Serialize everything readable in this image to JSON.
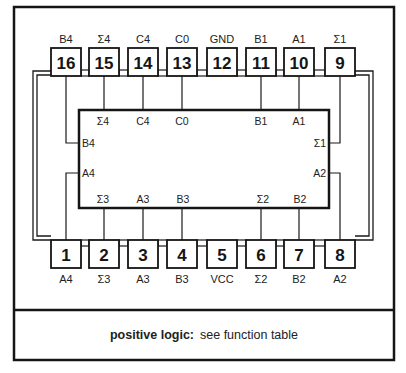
{
  "diagram": {
    "type": "ic-pinout",
    "package": "16-pin dual-in-line",
    "top_pins": [
      {
        "number": "16",
        "label": "B4"
      },
      {
        "number": "15",
        "label": "Σ4"
      },
      {
        "number": "14",
        "label": "C4"
      },
      {
        "number": "13",
        "label": "C0"
      },
      {
        "number": "12",
        "label": "GND"
      },
      {
        "number": "11",
        "label": "B1"
      },
      {
        "number": "10",
        "label": "A1"
      },
      {
        "number": "9",
        "label": "Σ1"
      }
    ],
    "bottom_pins": [
      {
        "number": "1",
        "label": "A4"
      },
      {
        "number": "2",
        "label": "Σ3"
      },
      {
        "number": "3",
        "label": "A3"
      },
      {
        "number": "4",
        "label": "B3"
      },
      {
        "number": "5",
        "label": "VCC"
      },
      {
        "number": "6",
        "label": "Σ2"
      },
      {
        "number": "7",
        "label": "B2"
      },
      {
        "number": "8",
        "label": "A2"
      }
    ],
    "inner_labels": {
      "top": [
        "Σ4",
        "C4",
        "C0",
        "B1",
        "A1"
      ],
      "bottom": [
        "Σ3",
        "A3",
        "B3",
        "Σ2",
        "B2"
      ],
      "left": [
        "B4",
        "A4"
      ],
      "right": [
        "Σ1",
        "A2"
      ]
    }
  },
  "footer": {
    "bold_label": "positive logic:",
    "text": "see function table"
  }
}
